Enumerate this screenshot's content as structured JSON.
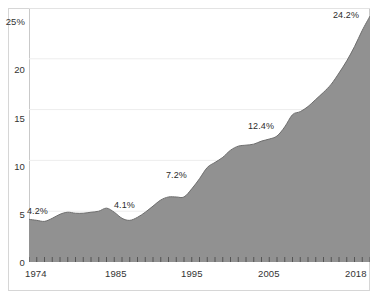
{
  "chart_data": {
    "type": "area",
    "title": "",
    "subtitle": "",
    "xlabel": "",
    "ylabel": "",
    "ylim": [
      0,
      25
    ],
    "xlim": [
      1974,
      2018
    ],
    "grid": true,
    "legend": null,
    "fill_color": "#919191",
    "line_color": "#6e6e6e",
    "y_ticks": [
      {
        "value": 25,
        "label": "25%"
      },
      {
        "value": 20,
        "label": "20"
      },
      {
        "value": 15,
        "label": "15"
      },
      {
        "value": 10,
        "label": "10"
      },
      {
        "value": 5,
        "label": "5"
      },
      {
        "value": 0,
        "label": "0"
      }
    ],
    "x_ticks": [
      {
        "value": 1974,
        "label": "1974"
      },
      {
        "value": 1985,
        "label": "1985"
      },
      {
        "value": 1995,
        "label": "1995"
      },
      {
        "value": 2005,
        "label": "2005"
      },
      {
        "value": 2018,
        "label": "2018"
      }
    ],
    "x": [
      1974,
      1975,
      1976,
      1977,
      1978,
      1979,
      1980,
      1981,
      1982,
      1983,
      1984,
      1985,
      1986,
      1987,
      1988,
      1989,
      1990,
      1991,
      1992,
      1993,
      1994,
      1995,
      1996,
      1997,
      1998,
      1999,
      2000,
      2001,
      2002,
      2003,
      2004,
      2005,
      2006,
      2007,
      2008,
      2009,
      2010,
      2011,
      2012,
      2013,
      2014,
      2015,
      2016,
      2017,
      2018
    ],
    "values": [
      4.2,
      4.1,
      4.0,
      4.3,
      4.7,
      4.9,
      4.8,
      4.8,
      4.9,
      5.0,
      5.3,
      4.9,
      4.3,
      4.1,
      4.4,
      4.9,
      5.5,
      6.1,
      6.4,
      6.4,
      6.4,
      7.2,
      8.2,
      9.3,
      9.8,
      10.3,
      11.0,
      11.4,
      11.5,
      11.6,
      11.9,
      12.1,
      12.4,
      13.3,
      14.5,
      14.8,
      15.3,
      16.0,
      16.7,
      17.5,
      18.6,
      19.8,
      21.2,
      22.8,
      24.2
    ],
    "annotations": [
      {
        "label": "4.2%",
        "x": 1974,
        "value": 4.2
      },
      {
        "label": "4.1%",
        "x": 1988,
        "value": 4.1
      },
      {
        "label": "7.2%",
        "x": 1995,
        "value": 7.2
      },
      {
        "label": "12.4%",
        "x": 2006,
        "value": 12.4
      },
      {
        "label": "24.2%",
        "x": 2018,
        "value": 24.2
      }
    ]
  },
  "axis": {
    "y_labels": [
      "25%",
      "20",
      "15",
      "10",
      "5",
      "0"
    ],
    "x_labels": [
      "1974",
      "1985",
      "1995",
      "2005",
      "2018"
    ]
  },
  "labels": {
    "a0": "4.2%",
    "a1": "4.1%",
    "a2": "7.2%",
    "a3": "12.4%",
    "a4": "24.2%"
  }
}
